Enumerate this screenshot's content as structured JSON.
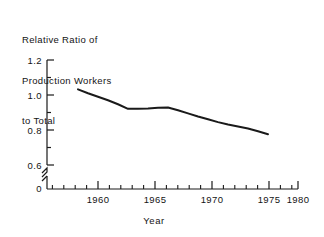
{
  "chart_data": {
    "type": "line",
    "title": "Relative Ratio of Production Workers to Total",
    "title_lines": [
      "Relative Ratio of",
      "Production Workers",
      "to Total"
    ],
    "xlabel": "Year",
    "ylabel": "",
    "xlim": [
      1957.0,
      1981.0
    ],
    "ylim": [
      0.55,
      1.22
    ],
    "y_axis_break": true,
    "y_break_label": "0",
    "grid": false,
    "legend": null,
    "x_major_ticks": [
      1960,
      1965,
      1970,
      1975,
      1980
    ],
    "x_tick_labels": [
      "1960",
      "1965",
      "1970",
      "1975",
      "1980"
    ],
    "x_minor_tick_step": 1,
    "y_major_ticks": [
      0.6,
      0.8,
      1.0,
      1.2
    ],
    "y_tick_labels": [
      "0.6",
      "0.8",
      "1.0",
      "1.2"
    ],
    "y_minor_ticks": [
      0.7,
      0.9,
      1.1
    ],
    "line_color": "#1a1a1a",
    "line_width": 2.0,
    "series": [
      {
        "name": "Relative Ratio of Production Workers to Total",
        "x": [
          1958,
          1959,
          1960,
          1961,
          1962,
          1963,
          1964,
          1965,
          1966,
          1967,
          1968,
          1969,
          1970,
          1971,
          1972,
          1973,
          1974,
          1975,
          1976,
          1977
        ],
        "values": [
          1.032,
          1.01,
          0.99,
          0.97,
          0.947,
          0.921,
          0.921,
          0.923,
          0.927,
          0.929,
          0.913,
          0.895,
          0.877,
          0.861,
          0.845,
          0.831,
          0.82,
          0.809,
          0.793,
          0.776
        ]
      }
    ]
  },
  "axis": {
    "x_ticks": [
      {
        "label": "1960"
      },
      {
        "label": "1965"
      },
      {
        "label": "1970"
      },
      {
        "label": "1975"
      },
      {
        "label": "1980"
      }
    ],
    "y_ticks": [
      {
        "label": "1.2"
      },
      {
        "label": "1.0"
      },
      {
        "label": "0.8"
      },
      {
        "label": "0.6"
      },
      {
        "label": "0"
      }
    ]
  }
}
